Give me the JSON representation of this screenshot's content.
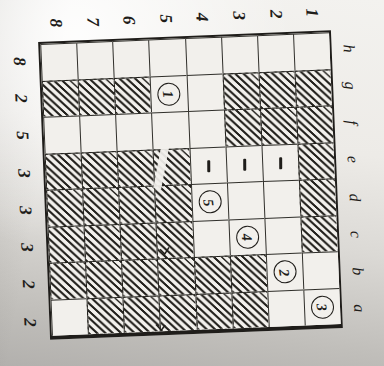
{
  "figure": {
    "top_labels": [
      "8",
      "7",
      "6",
      "5",
      "4",
      "3",
      "2",
      "1"
    ],
    "left_labels": [
      "8",
      "2",
      "5",
      "3",
      "3",
      "3",
      "2",
      "2"
    ],
    "right_labels": [
      "h",
      "g",
      "f",
      "e",
      "d",
      "c",
      "b",
      "a"
    ],
    "board": {
      "ranks_left_to_right": [
        "8",
        "7",
        "6",
        "5",
        "4",
        "3",
        "2",
        "1"
      ],
      "files_top_to_bottom": [
        "h",
        "g",
        "f",
        "e",
        "d",
        "c",
        "b",
        "a"
      ],
      "rows": [
        {
          "file": "h",
          "cells": [
            "empty",
            "empty",
            "empty",
            "empty",
            "empty",
            "empty",
            "empty",
            "empty"
          ]
        },
        {
          "file": "g",
          "cells": [
            "hatched",
            "hatched",
            "hatched",
            "circle:1",
            "empty",
            "hatched",
            "hatched",
            "hatched"
          ]
        },
        {
          "file": "f",
          "cells": [
            "empty",
            "empty",
            "empty",
            "empty",
            "empty",
            "hatched",
            "hatched",
            "hatched"
          ]
        },
        {
          "file": "e",
          "cells": [
            "hatched",
            "hatched",
            "hatched",
            "hatched",
            "dash",
            "dash",
            "dash",
            "hatched"
          ]
        },
        {
          "file": "d",
          "cells": [
            "hatched",
            "hatched",
            "hatched",
            "hatched",
            "circle:5",
            "empty",
            "empty",
            "hatched"
          ]
        },
        {
          "file": "c",
          "cells": [
            "hatched",
            "hatched",
            "hatched",
            "hatched",
            "empty",
            "circle:4",
            "empty",
            "hatched"
          ]
        },
        {
          "file": "b",
          "cells": [
            "hatched",
            "hatched",
            "hatched",
            "hatched",
            "hatched",
            "hatched",
            "circle:2",
            "empty"
          ]
        },
        {
          "file": "a",
          "cells": [
            "empty",
            "hatched",
            "hatched",
            "hatched",
            "hatched",
            "hatched",
            "empty",
            "circle:3"
          ]
        }
      ],
      "circled_numbers": [
        {
          "label": "1",
          "square": "g5"
        },
        {
          "label": "2",
          "square": "b2"
        },
        {
          "label": "3",
          "square": "a1"
        },
        {
          "label": "4",
          "square": "c3"
        },
        {
          "label": "5",
          "square": "d4"
        }
      ],
      "dash_squares": [
        "e4",
        "e3",
        "e2"
      ]
    },
    "colors": {
      "ink": "#1f1d1a",
      "paper_light": "#f2f0ec",
      "paper_shadow": "#b2b0ad"
    }
  }
}
